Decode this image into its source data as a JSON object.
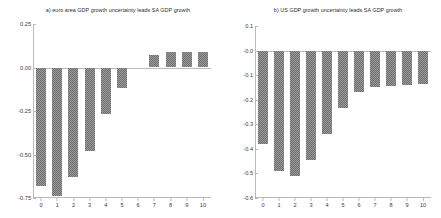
{
  "figure": {
    "background_color": "#ffffff",
    "bar_color": "#6f6f6f",
    "axis_color": "#b9b9b9"
  },
  "chart_data": [
    {
      "type": "bar",
      "panel": "a",
      "title": "a) euro area GDP growth uncertainty leads SA GDP growth",
      "xlabel": "",
      "ylabel": "",
      "categories": [
        "0",
        "1",
        "2",
        "3",
        "4",
        "5",
        "6",
        "7",
        "8",
        "9",
        "10"
      ],
      "values": [
        -0.68,
        -0.74,
        -0.63,
        -0.48,
        -0.27,
        -0.12,
        0.0,
        0.07,
        0.09,
        0.09,
        0.09
      ],
      "ylim": [
        -0.75,
        0.25
      ],
      "yticks": [
        0.25,
        0.0,
        -0.25,
        -0.5,
        -0.75
      ],
      "ytick_labels": [
        "0.25",
        "0.00",
        "-0.25",
        "-0.50",
        "-0.75"
      ],
      "grid": false,
      "legend": null
    },
    {
      "type": "bar",
      "panel": "b",
      "title": "b) US GDP growth uncertainty leads SA GDP growth",
      "xlabel": "",
      "ylabel": "",
      "categories": [
        "0",
        "1",
        "2",
        "3",
        "4",
        "5",
        "6",
        "7",
        "8",
        "9",
        "10"
      ],
      "values": [
        -0.38,
        -0.49,
        -0.51,
        -0.445,
        -0.34,
        -0.235,
        -0.17,
        -0.15,
        -0.145,
        -0.14,
        -0.135
      ],
      "ylim": [
        -0.6,
        0.1
      ],
      "yticks": [
        0.1,
        -0.0,
        -0.1,
        -0.2,
        -0.3,
        -0.4,
        -0.5,
        -0.6
      ],
      "ytick_labels": [
        "0.1",
        "-0.0",
        "-0.1",
        "-0.2",
        "-0.3",
        "-0.4",
        "-0.5",
        "-0.6"
      ],
      "grid": false,
      "legend": null
    }
  ]
}
